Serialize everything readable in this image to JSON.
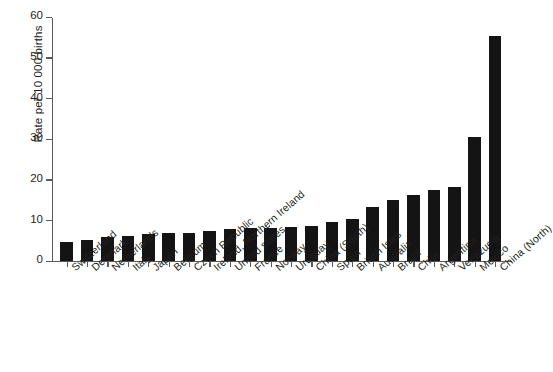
{
  "chart_data": {
    "type": "bar",
    "title": "",
    "xlabel": "",
    "ylabel": "Rate per 10 000 births",
    "ylim": [
      0,
      60
    ],
    "yticks": [
      0,
      10,
      20,
      30,
      40,
      50,
      60
    ],
    "ytick_labels": [
      "0",
      "10",
      "20",
      "30",
      "40",
      "50",
      "60"
    ],
    "grid": false,
    "legend": null,
    "bar_color": "#141414",
    "categories": [
      "Switzerland",
      "Denmark",
      "Netherlands",
      "Italy",
      "Japan",
      "Belgium",
      "Czech Republic",
      "Ireland, Northern Ireland",
      "United states",
      "France",
      "Norway",
      "Uruguay",
      "China (South)",
      "Spain",
      "British Isles",
      "Australia",
      "Brazil",
      "Chile",
      "Argentina",
      "Venezuela",
      "Mexico",
      "China (North)"
    ],
    "values": [
      4.6,
      5.2,
      5.9,
      6.2,
      6.6,
      6.8,
      7.0,
      7.5,
      7.8,
      8.0,
      8.1,
      8.3,
      8.6,
      9.7,
      10.4,
      13.2,
      14.9,
      16.2,
      17.5,
      18.2,
      30.6,
      55.4
    ]
  }
}
